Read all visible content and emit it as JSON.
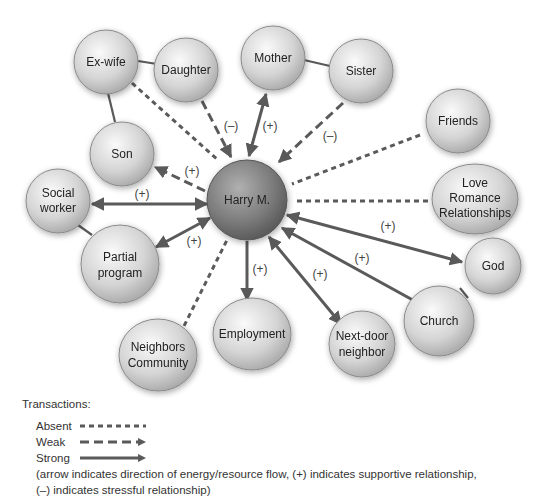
{
  "diagram": {
    "type": "ecomap",
    "center": {
      "id": "harry",
      "label": "Harry M."
    },
    "nodes": [
      {
        "id": "exwife",
        "lines": [
          "Ex-wife"
        ]
      },
      {
        "id": "daughter",
        "lines": [
          "Daughter"
        ]
      },
      {
        "id": "mother",
        "lines": [
          "Mother"
        ]
      },
      {
        "id": "sister",
        "lines": [
          "Sister"
        ]
      },
      {
        "id": "friends",
        "lines": [
          "Friends"
        ]
      },
      {
        "id": "love",
        "lines": [
          "Love",
          "Romance",
          "Relationships"
        ]
      },
      {
        "id": "son",
        "lines": [
          "Son"
        ]
      },
      {
        "id": "social",
        "lines": [
          "Social",
          "worker"
        ]
      },
      {
        "id": "partial",
        "lines": [
          "Partial",
          "program"
        ]
      },
      {
        "id": "god",
        "lines": [
          "God"
        ]
      },
      {
        "id": "church",
        "lines": [
          "Church"
        ]
      },
      {
        "id": "neighbors",
        "lines": [
          "Neighbors",
          "Community"
        ]
      },
      {
        "id": "employment",
        "lines": [
          "Employment"
        ]
      },
      {
        "id": "nextdoor",
        "lines": [
          "Next-door",
          "neighbor"
        ]
      }
    ],
    "edges": [
      {
        "from": "exwife",
        "to": "harry",
        "type": "absent"
      },
      {
        "from": "daughter",
        "to": "harry",
        "type": "weak",
        "arrow": "to_harry",
        "sign": "(–)"
      },
      {
        "from": "mother",
        "to": "harry",
        "type": "strong",
        "arrow": "both",
        "sign": "(+)"
      },
      {
        "from": "sister",
        "to": "harry",
        "type": "weak",
        "arrow": "to_harry",
        "sign": "(–)"
      },
      {
        "from": "friends",
        "to": "harry",
        "type": "absent"
      },
      {
        "from": "love",
        "to": "harry",
        "type": "absent"
      },
      {
        "from": "harry",
        "to": "son",
        "type": "weak",
        "arrow": "to_son",
        "sign": "(+)"
      },
      {
        "from": "social",
        "to": "harry",
        "type": "strong",
        "arrow": "both",
        "sign": "(+)"
      },
      {
        "from": "partial",
        "to": "harry",
        "type": "strong",
        "arrow": "both",
        "sign": "(+)"
      },
      {
        "from": "harry",
        "to": "god",
        "type": "strong",
        "arrow": "both",
        "sign": "(+)"
      },
      {
        "from": "church",
        "to": "harry",
        "type": "strong",
        "arrow": "to_harry",
        "sign": "(+)"
      },
      {
        "from": "neighbors",
        "to": "harry",
        "type": "absent"
      },
      {
        "from": "harry",
        "to": "employment",
        "type": "strong",
        "arrow": "to_employment",
        "sign": "(+)"
      },
      {
        "from": "nextdoor",
        "to": "harry",
        "type": "strong",
        "arrow": "both",
        "sign": "(+)"
      }
    ],
    "links": [
      {
        "from": "exwife",
        "to": "daughter"
      },
      {
        "from": "exwife",
        "to": "son"
      },
      {
        "from": "mother",
        "to": "sister"
      },
      {
        "from": "social",
        "to": "partial"
      },
      {
        "from": "god",
        "to": "church"
      }
    ]
  },
  "legend": {
    "title": "Transactions:",
    "items": [
      {
        "label": "Absent",
        "style": "dotted"
      },
      {
        "label": "Weak",
        "style": "dashed-arrow"
      },
      {
        "label": "Strong",
        "style": "solid-arrow"
      }
    ],
    "note_line1": "(arrow indicates direction of energy/resource flow, (+) indicates supportive relationship,",
    "note_line2": "(–) indicates stressful relationship)"
  },
  "colors": {
    "line": "#5a5a5a",
    "node_light": "#f2f2f2",
    "node_dark": "#a8a8a8",
    "center_dark": "#5c5c5c",
    "center_light": "#a0a0a0"
  }
}
